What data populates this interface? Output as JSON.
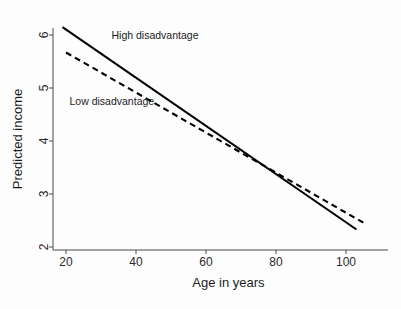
{
  "chart_data": {
    "type": "line",
    "title": "",
    "xlabel": "Age in years",
    "ylabel": "Predicted income",
    "xlim": [
      15,
      110
    ],
    "ylim": [
      1.8,
      6.4
    ],
    "xticks": [
      20,
      40,
      60,
      80,
      100
    ],
    "xtick_labels": [
      "20",
      "40",
      "60",
      "80",
      "100"
    ],
    "yticks": [
      2,
      3,
      4,
      5,
      6
    ],
    "ytick_labels": [
      "2",
      "3",
      "4",
      "5",
      "6"
    ],
    "grid": false,
    "legend_position": "inline-annotations",
    "series": [
      {
        "name": "High disadvantage",
        "style": "solid",
        "color": "#000000",
        "x": [
          19,
          103
        ],
        "values": [
          6.15,
          2.33
        ],
        "label_text": "High disadvantage",
        "label_x": 33,
        "label_y": 5.93
      },
      {
        "name": "Low disadvantage",
        "style": "dashed",
        "color": "#000000",
        "x": [
          20,
          106
        ],
        "values": [
          5.67,
          2.42
        ],
        "label_text": "Low disadvantage",
        "label_x": 21,
        "label_y": 4.68
      }
    ],
    "annotations": [
      {
        "text": "High disadvantage",
        "series": "High disadvantage"
      },
      {
        "text": "Low disadvantage",
        "series": "Low disadvantage"
      }
    ],
    "crossover": {
      "x": 87,
      "y": 3.2
    }
  }
}
